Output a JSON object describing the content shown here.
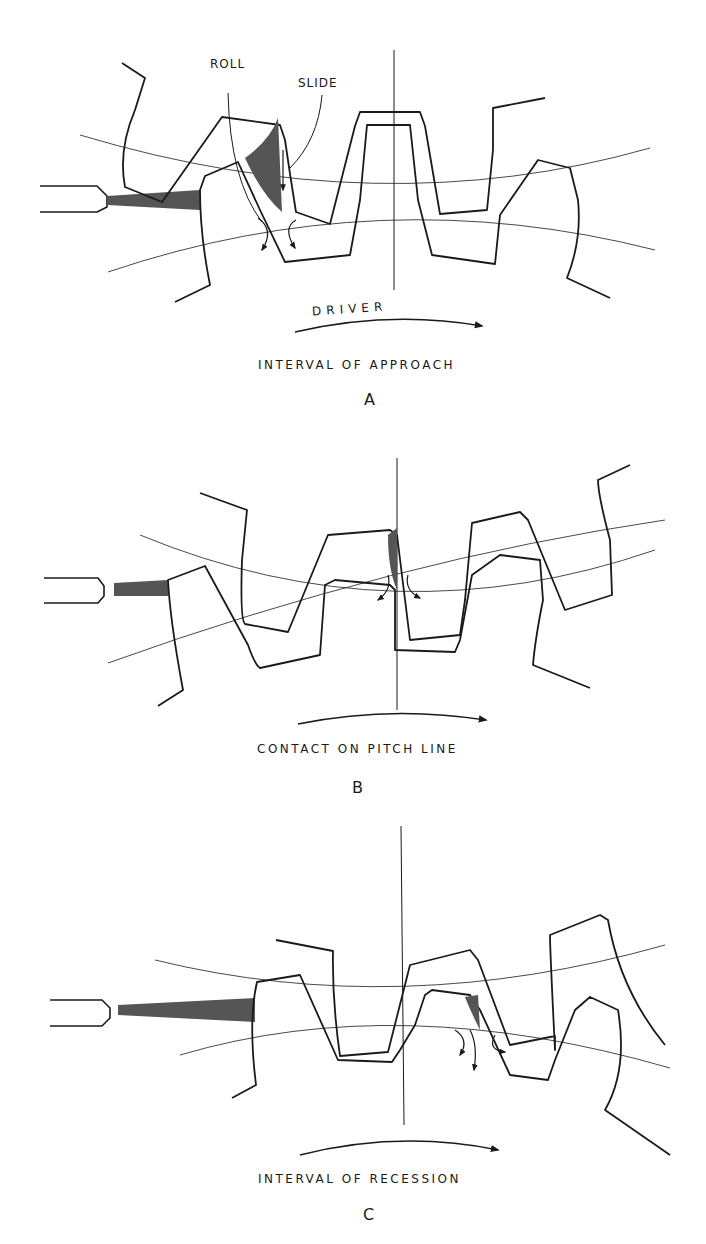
{
  "figure": {
    "panels": [
      {
        "id": "A",
        "letter": "A",
        "caption": "INTERVAL OF APPROACH",
        "arrow_label": "DRIVER",
        "callouts": {
          "roll": "ROLL",
          "slide": "SLIDE"
        }
      },
      {
        "id": "B",
        "letter": "B",
        "caption": "CONTACT ON PITCH LINE"
      },
      {
        "id": "C",
        "letter": "C",
        "caption": "INTERVAL OF RECESSION"
      }
    ],
    "colors": {
      "ink": "#1a1a1a",
      "shade": "#555555",
      "background": "#ffffff"
    }
  }
}
